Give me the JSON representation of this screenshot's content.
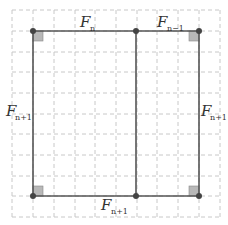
{
  "diagram": {
    "colors": {
      "grid": "#c8c8c8",
      "edge": "#555555",
      "point": "#444444",
      "right_angle_fill": "#b8b8b8"
    },
    "grid": {
      "x0": 12,
      "y0": 10,
      "cell": 20.75,
      "cols": 10,
      "rows": 10
    },
    "points": [
      {
        "id": "TL",
        "x": 33,
        "y": 31
      },
      {
        "id": "TM",
        "x": 136,
        "y": 31
      },
      {
        "id": "TR",
        "x": 199,
        "y": 31
      },
      {
        "id": "BL",
        "x": 33,
        "y": 196
      },
      {
        "id": "BM",
        "x": 136,
        "y": 196
      },
      {
        "id": "BR",
        "x": 199,
        "y": 196
      }
    ],
    "labels": {
      "top_left": {
        "base": "F",
        "sub": "n"
      },
      "top_right": {
        "base": "F",
        "sub": "n−1"
      },
      "left": {
        "base": "F",
        "sub": "n+1"
      },
      "right": {
        "base": "F",
        "sub": "n+1"
      },
      "bottom": {
        "base": "F",
        "sub": "n+1"
      }
    }
  }
}
